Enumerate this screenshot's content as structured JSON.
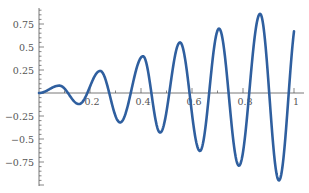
{
  "chart_data": {
    "type": "line",
    "title": "",
    "xlabel": "",
    "ylabel": "",
    "xlim": [
      0,
      1
    ],
    "ylim": [
      -1,
      1
    ],
    "grid": false,
    "legend": null,
    "x_ticks": [
      0.2,
      0.4,
      0.6,
      0.8,
      1
    ],
    "x_tick_labels": [
      "0.2",
      "0.4",
      "0.6",
      "0.8",
      "1"
    ],
    "y_ticks": [
      0.75,
      0.5,
      0.25,
      -0.25,
      -0.5,
      -0.75
    ],
    "y_tick_labels": [
      "0.75",
      "0.5",
      "0.25",
      "-0.25",
      "-0.5",
      "-0.75"
    ],
    "series": [
      {
        "name": "f(x)",
        "color": "#2f5f9f",
        "function_hint": "approx x*sin(40.5x - 1.7)",
        "extrema": [
          {
            "x": 0.08,
            "y": 0.08
          },
          {
            "x": 0.157,
            "y": -0.12
          },
          {
            "x": 0.24,
            "y": 0.24
          },
          {
            "x": 0.318,
            "y": -0.32
          },
          {
            "x": 0.408,
            "y": 0.4
          },
          {
            "x": 0.475,
            "y": -0.43
          },
          {
            "x": 0.553,
            "y": 0.55
          },
          {
            "x": 0.631,
            "y": -0.63
          },
          {
            "x": 0.706,
            "y": 0.7
          },
          {
            "x": 0.784,
            "y": -0.79
          },
          {
            "x": 0.867,
            "y": 0.86
          },
          {
            "x": 0.941,
            "y": -0.95
          },
          {
            "x": 1.0,
            "y": 0.67
          }
        ]
      }
    ]
  },
  "axis": {
    "color": "#555555"
  }
}
